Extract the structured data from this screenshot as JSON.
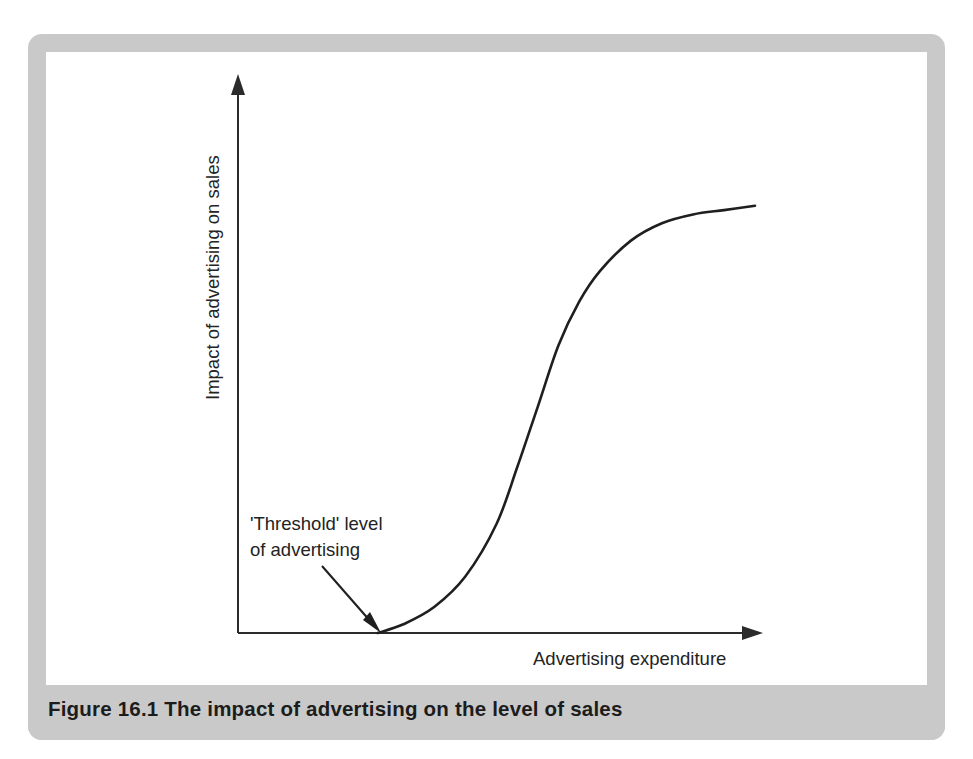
{
  "figure": {
    "caption": "Figure 16.1  The impact of advertising on the level of sales",
    "frame_color": "#c9c9c9",
    "panel_color": "#ffffff",
    "ink_color": "#1f1f1f"
  },
  "chart_data": {
    "type": "line",
    "title": "",
    "subtitle": "",
    "xlabel": "Advertising expenditure",
    "ylabel": "Impact of advertising on sales",
    "xlim": [
      0,
      100
    ],
    "ylim": [
      0,
      100
    ],
    "grid": false,
    "legend": null,
    "axis_ticks": {
      "x": [],
      "y": []
    },
    "axes_style": "arrowed-open-axes",
    "series": [
      {
        "name": "Advertising response curve",
        "shape": "sigmoid",
        "x": [
          27,
          32,
          38,
          44,
          50,
          54,
          58,
          62,
          66,
          70,
          76,
          82,
          88,
          94,
          100
        ],
        "y": [
          0,
          2,
          6,
          13,
          25,
          38,
          52,
          66,
          76,
          83,
          90,
          94,
          96,
          97,
          98
        ]
      }
    ],
    "annotations": [
      {
        "name": "threshold-annotation",
        "text_lines": [
          "'Threshold' level",
          "of advertising"
        ],
        "points_to_x": 27,
        "points_to_y": 0,
        "arrow": true
      }
    ]
  }
}
